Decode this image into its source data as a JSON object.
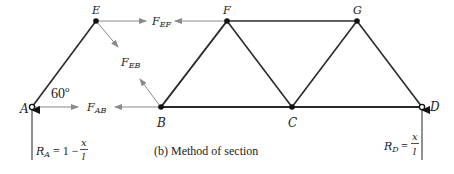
{
  "diagram": {
    "caption": "(b) Method of section",
    "angle_label": "60",
    "angle_degree": "o",
    "nodes": {
      "A": "A",
      "B": "B",
      "C": "C",
      "D": "D",
      "E": "E",
      "F": "F",
      "G": "G"
    },
    "forces": {
      "F_EF": {
        "main": "F",
        "sub": "EF"
      },
      "F_EB": {
        "main": "F",
        "sub": "EB"
      },
      "F_AB": {
        "main": "F",
        "sub": "AB"
      }
    },
    "reactions": {
      "R_A": {
        "main": "R",
        "sub": "A",
        "eq": "= 1 −",
        "num": "x",
        "den": "l"
      },
      "R_D": {
        "main": "R",
        "sub": "D",
        "eq": "=",
        "num": "x",
        "den": "l"
      }
    },
    "colors": {
      "member": "#2a2a2a",
      "force_arrow": "#8a8a8a",
      "text": "#222222"
    }
  }
}
